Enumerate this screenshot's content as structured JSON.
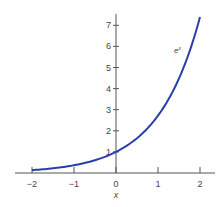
{
  "chart_data": {
    "type": "line",
    "title": "",
    "xlabel": "x",
    "ylabel": "",
    "xlim": [
      -2.3,
      2.4
    ],
    "ylim": [
      0,
      7.4
    ],
    "x_ticks": [
      -2,
      -1,
      0,
      1,
      2
    ],
    "x_tick_labels": [
      "−2",
      "−1",
      "0",
      "1",
      "2"
    ],
    "y_ticks": [
      1,
      2,
      3,
      4,
      5,
      6,
      7
    ],
    "y_tick_labels": [
      "1",
      "2",
      "3",
      "4",
      "5",
      "6",
      "7"
    ],
    "grid": false,
    "series": [
      {
        "name": "e^x",
        "label": "e",
        "label_sup": "x",
        "color": "#2b3fa8",
        "x": [
          -2,
          -1.5,
          -1,
          -0.5,
          0,
          0.5,
          1,
          1.5,
          2
        ],
        "values": [
          0.135,
          0.223,
          0.368,
          0.607,
          1.0,
          1.649,
          2.718,
          4.482,
          7.389
        ]
      }
    ]
  }
}
